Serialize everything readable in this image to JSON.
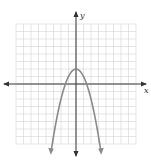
{
  "chart_data": {
    "type": "line",
    "title": "",
    "xlabel": "x",
    "ylabel": "y",
    "function": "y = 2 - x^2",
    "xlim": [
      -8,
      8
    ],
    "ylim": [
      -8,
      8
    ],
    "grid": true,
    "series": [
      {
        "name": "parabola",
        "color": "#8a8a8a",
        "x": [
          -3.3,
          -3,
          -2,
          -1.41,
          -1,
          0,
          1,
          1.41,
          2,
          3,
          3.3
        ],
        "y": [
          -8.89,
          -7,
          -2,
          0,
          1,
          2,
          1,
          0,
          -2,
          -7,
          -8.89
        ]
      }
    ],
    "vertex": [
      0,
      2
    ],
    "x_intercepts": [
      -1.41,
      1.41
    ]
  },
  "axis_color": "#333333",
  "grid_color": "#d4d4d4"
}
